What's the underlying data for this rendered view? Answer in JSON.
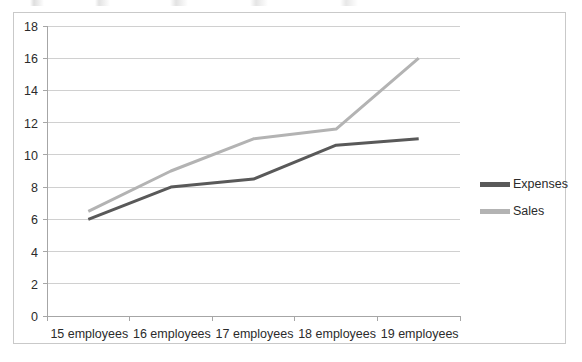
{
  "chart_data": {
    "type": "line",
    "title": "",
    "xlabel": "",
    "ylabel": "",
    "categories": [
      "15 employees",
      "16 employees",
      "17 employees",
      "18 employees",
      "19 employees"
    ],
    "series": [
      {
        "name": "Expenses",
        "color": "#595959",
        "values": [
          6,
          8,
          8.5,
          10.6,
          11
        ]
      },
      {
        "name": "Sales",
        "color": "#b3b3b3",
        "values": [
          6.5,
          9,
          11,
          11.6,
          16
        ]
      }
    ],
    "ylim": [
      0,
      18
    ],
    "ytick_step": 2,
    "yticks": [
      0,
      2,
      4,
      6,
      8,
      10,
      12,
      14,
      16,
      18
    ],
    "ytick_labels": [
      "0",
      "2",
      "4",
      "6",
      "8",
      "10",
      "12",
      "14",
      "16",
      "18"
    ],
    "grid": "horizontal",
    "legend_position": "right",
    "border": true,
    "marker": "none",
    "line_width": 3
  },
  "colors": {
    "frame_border": "#c9c9c9",
    "gridline": "#d0d0d0",
    "axis": "#a6a6a6",
    "tick_text": "#2b2b2b",
    "expenses": "#595959",
    "sales": "#b3b3b3",
    "background": "#ffffff"
  },
  "legend": {
    "items": [
      {
        "label": "Expenses",
        "color": "#595959"
      },
      {
        "label": "Sales",
        "color": "#b3b3b3"
      }
    ]
  }
}
